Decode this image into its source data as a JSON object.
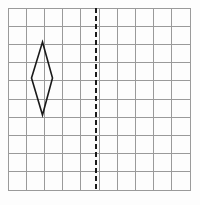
{
  "canvas": {
    "width": 200,
    "height": 205,
    "background_color": "#fdfdfd",
    "title": "Coordinate grid with shaded quadrilateral and dashed line of reflection"
  },
  "grid": {
    "name": "square-grid",
    "columns": 10,
    "rows": 10,
    "origin_x": 8,
    "origin_y": 8,
    "cell_width": 18.2,
    "cell_height": 18.2,
    "total_width": 182,
    "total_height": 182,
    "line_color": "#9a9a9a",
    "line_width": 1,
    "border_color": "#9a9a9a",
    "border_width": 1
  },
  "mirror_line": {
    "name": "line-of-reflection",
    "orientation": "vertical",
    "x": 96.2,
    "y_start": 8,
    "y_end": 190,
    "grid_column_index": 5,
    "color": "#1a1a1a",
    "line_width": 2,
    "dash_on": 5,
    "dash_off": 3,
    "style": "dashed"
  },
  "shape": {
    "name": "rhombus-kite",
    "type": "polygon",
    "vertex_count": 4,
    "points": "42.5,42 52.5,78 42.5,115 31.5,78",
    "vertices": [
      {
        "label": "top",
        "x": 42.5,
        "y": 42
      },
      {
        "label": "right",
        "x": 52.5,
        "y": 78
      },
      {
        "label": "bottom",
        "x": 42.5,
        "y": 115
      },
      {
        "label": "left",
        "x": 31.5,
        "y": 78
      }
    ],
    "stroke_color": "#1a1a1a",
    "stroke_width": 1.6,
    "fill_color": "#ffffff",
    "fill": "none"
  },
  "chart_data": {
    "type": "scatter",
    "xlabel": "",
    "ylabel": "",
    "xlim": [
      0,
      10
    ],
    "ylim": [
      0,
      10
    ],
    "grid": true,
    "legend": "none",
    "annotations": [
      "Vertical dashed line of reflection at grid column 5",
      "Kite shaped quadrilateral located left of the dashed line"
    ],
    "series": [
      {
        "name": "quadrilateral-vertices-grid-units",
        "x": [
          1.9,
          2.45,
          1.9,
          1.3
        ],
        "y": [
          8.1,
          6.15,
          4.1,
          6.15
        ]
      },
      {
        "name": "line-of-reflection-grid-units",
        "x": [
          4.85,
          4.85
        ],
        "y": [
          0,
          10
        ]
      }
    ]
  }
}
